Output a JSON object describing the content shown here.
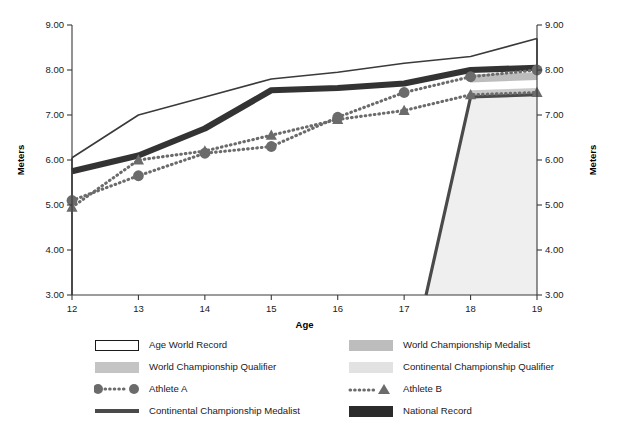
{
  "chart_data": {
    "type": "line",
    "title": "",
    "xlabel": "Age",
    "ylabel": "Meters",
    "ylabel_right": "Meters",
    "x": [
      12,
      13,
      14,
      15,
      16,
      17,
      18,
      19
    ],
    "xlim": [
      12,
      19
    ],
    "ylim": [
      3.0,
      9.0
    ],
    "ytick_labels": [
      "9.00",
      "8.00",
      "7.00",
      "6.00",
      "5.00",
      "4.00",
      "3.00"
    ],
    "ytick_values": [
      9.0,
      8.0,
      7.0,
      6.0,
      5.0,
      4.0,
      3.0
    ],
    "xtick_labels": [
      "12",
      "13",
      "14",
      "15",
      "16",
      "17",
      "18",
      "19"
    ],
    "grid": false,
    "legend_position": "bottom",
    "series": [
      {
        "name": "Age World Record",
        "style": "outline-area",
        "color": "#3a3a3a",
        "fill": "#ffffff",
        "values": [
          6.05,
          7.0,
          7.4,
          7.8,
          7.95,
          8.15,
          8.3,
          8.7
        ]
      },
      {
        "name": "National Record",
        "style": "thick-line",
        "color": "#333333",
        "values": [
          5.75,
          6.1,
          6.7,
          7.55,
          7.6,
          7.7,
          8.0,
          8.05
        ]
      },
      {
        "name": "World Championship Medalist",
        "style": "band",
        "color": "#bcbcbc",
        "values": [
          null,
          null,
          null,
          null,
          null,
          null,
          7.9,
          7.95
        ],
        "band_low": [
          null,
          null,
          null,
          null,
          null,
          null,
          7.72,
          7.78
        ]
      },
      {
        "name": "World Championship Qualifier",
        "style": "band",
        "color": "#c9c9c9",
        "values": [
          null,
          null,
          null,
          null,
          null,
          null,
          7.55,
          7.6
        ],
        "band_low": [
          null,
          null,
          null,
          null,
          null,
          null,
          7.38,
          7.42
        ]
      },
      {
        "name": "Continental Championship Qualifier",
        "style": "area",
        "color": "#efefef",
        "values": [
          null,
          null,
          null,
          null,
          null,
          3.0,
          7.4,
          7.45
        ]
      },
      {
        "name": "Continental Championship Medalist",
        "style": "thick-line",
        "color": "#4a4a4a",
        "values": [
          null,
          null,
          null,
          null,
          null,
          3.0,
          7.4,
          7.45
        ]
      },
      {
        "name": "Athlete A",
        "style": "dotted-marker-circle",
        "color": "#6b6b6b",
        "values": [
          5.1,
          5.65,
          6.15,
          6.3,
          6.95,
          7.5,
          7.85,
          8.0
        ]
      },
      {
        "name": "Athlete B",
        "style": "dotted-marker-triangle",
        "color": "#6b6b6b",
        "values": [
          4.95,
          6.0,
          6.2,
          6.55,
          6.9,
          7.1,
          7.45,
          7.5
        ]
      }
    ]
  },
  "axes": {
    "left_title": "Meters",
    "right_title": "Meters",
    "x_title": "Age"
  },
  "legend": {
    "left_column": [
      {
        "label": "Age World Record",
        "swatch": "outline-box",
        "color": "#ffffff",
        "border": "#1a1a1a"
      },
      {
        "label": "World Championship Qualifier",
        "swatch": "filled-box",
        "color": "#c4c4c4",
        "border": "none"
      },
      {
        "label": "Athlete A",
        "swatch": "dotted-circle-line",
        "color": "#6b6b6b",
        "border": "none"
      },
      {
        "label": "Continental Championship Medalist",
        "swatch": "thick-line",
        "color": "#4a4a4a",
        "border": "none"
      }
    ],
    "right_column": [
      {
        "label": "World Championship Medalist",
        "swatch": "filled-box",
        "color": "#bdbdbd",
        "border": "none"
      },
      {
        "label": "Continental Championship Qualifier",
        "swatch": "filled-box",
        "color": "#e2e2e2",
        "border": "none"
      },
      {
        "label": "Athlete B",
        "swatch": "dotted-triangle-line",
        "color": "#6b6b6b",
        "border": "none"
      },
      {
        "label": "National Record",
        "swatch": "filled-box",
        "color": "#2b2b2b",
        "border": "none"
      }
    ]
  },
  "colors": {
    "axis": "#3a3a3a",
    "text": "#1a1a1a",
    "marker": "#6b6b6b",
    "national_record": "#2b2b2b",
    "age_world_record": "#3a3a3a",
    "continental_medalist": "#4a4a4a",
    "wc_medalist_band": "#bdbdbd",
    "wc_qualifier_band": "#c9c9c9",
    "cc_qualifier_area": "#efefef",
    "background": "#ffffff"
  }
}
